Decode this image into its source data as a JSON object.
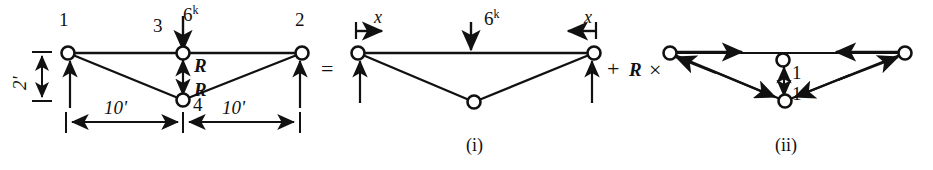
{
  "figure": {
    "type": "structural-truss-force-superposition-diagram",
    "panels": [
      {
        "id": "original",
        "name": "original-truss",
        "nodes": [
          {
            "label": "1",
            "x": 68,
            "y": 53,
            "label_x": 60,
            "label_y": 14
          },
          {
            "label": "2",
            "x": 302,
            "y": 53,
            "label_x": 296,
            "label_y": 14
          },
          {
            "label": "3",
            "x": 183,
            "y": 53,
            "label_x": 155,
            "label_y": 20
          },
          {
            "label": "4",
            "x": 183,
            "y": 100,
            "label_x": 194,
            "label_y": 96
          }
        ],
        "load_label": "6",
        "load_sup": "k",
        "redundant_label_top": "R",
        "redundant_label_bottom": "R",
        "height_dim": "2'",
        "span_dim_left": "10'",
        "span_dim_right": "10'"
      },
      {
        "id": "i",
        "name": "primary-system",
        "caption": "(i)",
        "load_label": "6",
        "load_sup": "k",
        "x_label_left": "x",
        "x_label_right": "x",
        "nodes": [
          {
            "x": 358,
            "y": 53
          },
          {
            "x": 594,
            "y": 53
          },
          {
            "x": 474,
            "y": 102
          }
        ]
      },
      {
        "id": "ii",
        "name": "unit-load-system",
        "caption": "(ii)",
        "unit_label_top": "1",
        "unit_label_bottom": "1",
        "nodes": [
          {
            "x": 670,
            "y": 53
          },
          {
            "x": 905,
            "y": 53
          },
          {
            "x": 783,
            "y": 60
          },
          {
            "x": 785,
            "y": 101
          }
        ]
      }
    ],
    "operators": {
      "equals": "=",
      "plus": "+",
      "r_symbol": "R",
      "times": "×"
    },
    "colors": {
      "ink": "#111111",
      "background": "#ffffff"
    }
  }
}
